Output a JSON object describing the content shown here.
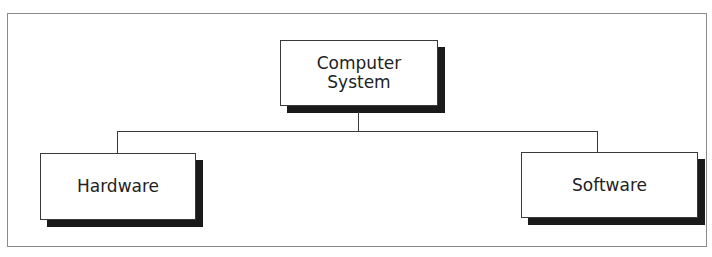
{
  "diagram": {
    "type": "hierarchy-tree",
    "root": {
      "label": "Computer\nSystem"
    },
    "children": [
      {
        "label": "Hardware"
      },
      {
        "label": "Software"
      }
    ],
    "colors": {
      "border": "#3a3a3a",
      "shadow": "#1a1a1a",
      "frame": "#8a8a8a",
      "text": "#222222",
      "background": "#ffffff"
    }
  }
}
